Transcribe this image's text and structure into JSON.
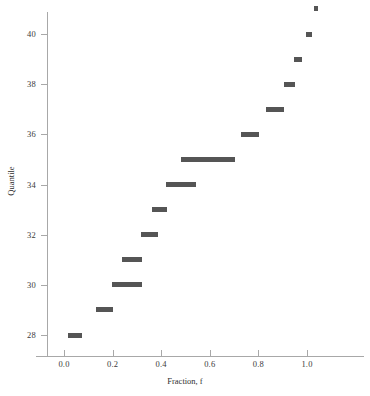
{
  "chart_data": {
    "type": "scatter",
    "title": "",
    "xlabel": "Fraction, f",
    "ylabel": "Quantile",
    "xlim": [
      -0.115,
      1.16
    ],
    "ylim": [
      27.2,
      41.35
    ],
    "grid": false,
    "legend": null,
    "marker_style": "horizontal-bar-segment",
    "marker_color": "#555555",
    "axis_color": "#a8a8a8",
    "xticks": [
      0.0,
      0.2,
      0.4,
      0.6,
      0.8,
      1.0
    ],
    "xtick_labels": [
      "0.0",
      "0.2",
      "0.4",
      "0.6",
      "0.8",
      "1.0"
    ],
    "yticks": [
      28,
      30,
      32,
      34,
      36,
      38,
      40
    ],
    "ytick_labels": [
      "28",
      "30",
      "32",
      "34",
      "36",
      "38",
      "40"
    ],
    "series": [
      {
        "name": "quantile-steps",
        "segments": [
          {
            "quantile": 28,
            "f_start": 0.016,
            "f_end": 0.074
          },
          {
            "quantile": 29,
            "f_start": 0.131,
            "f_end": 0.201
          },
          {
            "quantile": 30,
            "f_start": 0.197,
            "f_end": 0.32
          },
          {
            "quantile": 31,
            "f_start": 0.239,
            "f_end": 0.321
          },
          {
            "quantile": 32,
            "f_start": 0.317,
            "f_end": 0.387
          },
          {
            "quantile": 33,
            "f_start": 0.362,
            "f_end": 0.424
          },
          {
            "quantile": 34,
            "f_start": 0.42,
            "f_end": 0.543
          },
          {
            "quantile": 35,
            "f_start": 0.481,
            "f_end": 0.703
          },
          {
            "quantile": 36,
            "f_start": 0.728,
            "f_end": 0.802
          },
          {
            "quantile": 37,
            "f_start": 0.831,
            "f_end": 0.905
          },
          {
            "quantile": 38,
            "f_start": 0.905,
            "f_end": 0.95
          },
          {
            "quantile": 39,
            "f_start": 0.946,
            "f_end": 0.979
          },
          {
            "quantile": 40,
            "f_start": 0.995,
            "f_end": 1.021
          },
          {
            "quantile": 41,
            "f_start": 1.029,
            "f_end": 1.045
          }
        ]
      }
    ]
  }
}
